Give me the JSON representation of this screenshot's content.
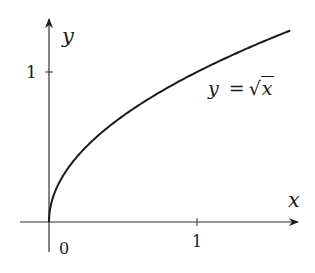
{
  "chart_data": {
    "type": "line",
    "title": "",
    "function": "y = sqrt(x)",
    "annotation": "y = √x",
    "xlabel": "x",
    "ylabel": "y",
    "x_ticks": [
      {
        "value": 0,
        "label": "0"
      },
      {
        "value": 1,
        "label": "1"
      }
    ],
    "y_ticks": [
      {
        "value": 1,
        "label": "1"
      }
    ],
    "xlim": [
      -0.2,
      1.63
    ],
    "ylim": [
      -0.2,
      1.35
    ],
    "grid": false,
    "series": [
      {
        "name": "y = √x",
        "x": [
          0,
          0.05,
          0.1,
          0.25,
          0.5,
          0.75,
          1.0,
          1.25,
          1.5,
          1.63
        ],
        "y": [
          0,
          0.224,
          0.316,
          0.5,
          0.707,
          0.866,
          1.0,
          1.118,
          1.225,
          1.277
        ]
      }
    ],
    "colors": {
      "curve": "#1a1a1a",
      "axes": "#333333"
    }
  },
  "labels": {
    "x_axis": "x",
    "y_axis": "y",
    "origin": "0",
    "x_tick_1": "1",
    "y_tick_1": "1",
    "eq_lhs": "y",
    "eq_eq": "=",
    "eq_rhs": "x"
  }
}
